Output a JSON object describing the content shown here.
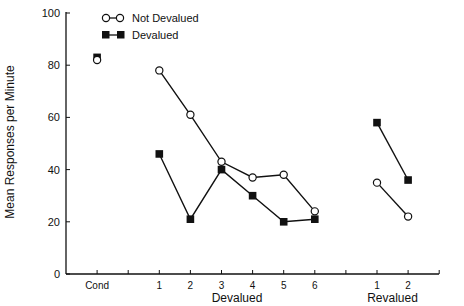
{
  "chart_data": {
    "type": "line",
    "title": "",
    "xlabel": "",
    "ylabel": "Mean Responses per Minute",
    "ylim": [
      0,
      100
    ],
    "yticks": [
      0,
      20,
      40,
      60,
      80,
      100
    ],
    "grid": false,
    "legend_position": "top-left",
    "x_slots": [
      {
        "slot": 1,
        "label": "Cond"
      },
      {
        "slot": 2,
        "label": ""
      },
      {
        "slot": 3,
        "label": "1"
      },
      {
        "slot": 4,
        "label": "2"
      },
      {
        "slot": 5,
        "label": "3"
      },
      {
        "slot": 6,
        "label": "4"
      },
      {
        "slot": 7,
        "label": "5"
      },
      {
        "slot": 8,
        "label": "6"
      },
      {
        "slot": 9,
        "label": ""
      },
      {
        "slot": 10,
        "label": "1"
      },
      {
        "slot": 11,
        "label": "2"
      }
    ],
    "group_labels": [
      {
        "label": "Devalued",
        "center_slot": 5.5
      },
      {
        "label": "Revalued",
        "center_slot": 10.5
      }
    ],
    "categories": [
      "Cond",
      "Devalued 1",
      "Devalued 2",
      "Devalued 3",
      "Devalued 4",
      "Devalued 5",
      "Devalued 6",
      "Revalued 1",
      "Revalued 2"
    ],
    "series": [
      {
        "name": "Not Devalued",
        "marker": "open-circle",
        "values": [
          82,
          78,
          61,
          43,
          37,
          38,
          24,
          35,
          22
        ],
        "segments": [
          [
            0
          ],
          [
            1,
            2,
            3,
            4,
            5,
            6
          ],
          [
            7,
            8
          ]
        ]
      },
      {
        "name": "Devalued",
        "marker": "filled-square",
        "values": [
          83,
          46,
          21,
          40,
          30,
          20,
          21,
          58,
          36
        ],
        "segments": [
          [
            0
          ],
          [
            1,
            2,
            3,
            4,
            5,
            6
          ],
          [
            7,
            8
          ]
        ]
      }
    ]
  },
  "legend": {
    "items": [
      {
        "label": "Not Devalued",
        "marker": "open-circle"
      },
      {
        "label": "Devalued",
        "marker": "filled-square"
      }
    ]
  },
  "colors": {
    "ink": "#111111",
    "background": "#ffffff"
  }
}
